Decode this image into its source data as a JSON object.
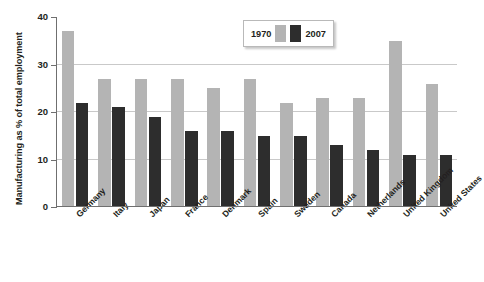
{
  "chart_data": {
    "type": "bar",
    "title": "",
    "xlabel": "",
    "ylabel": "Manufacturing as % of total employment",
    "ylim": [
      0,
      40
    ],
    "yticks": [
      0,
      10,
      20,
      30,
      40
    ],
    "grid": true,
    "legend_position": "top-center",
    "categories": [
      "Germany",
      "Italy",
      "Japan",
      "France",
      "Denmark",
      "Spain",
      "Sweden",
      "Canada",
      "Netherlands",
      "United Kingdom",
      "United States"
    ],
    "series": [
      {
        "name": "1970",
        "color": "#b4b4b4",
        "values": [
          37,
          27,
          27,
          27,
          25,
          27,
          22,
          23,
          23,
          35,
          26
        ]
      },
      {
        "name": "2007",
        "color": "#2d2d2d",
        "values": [
          22,
          21,
          19,
          16,
          16,
          15,
          15,
          13,
          12,
          11,
          11
        ]
      }
    ]
  },
  "legend": {
    "left_label": "1970",
    "right_label": "2007"
  },
  "axis": {
    "y_title": "Manufacturing as % of total employment",
    "y_tick_labels": [
      "0",
      "10",
      "20",
      "30",
      "40"
    ]
  }
}
